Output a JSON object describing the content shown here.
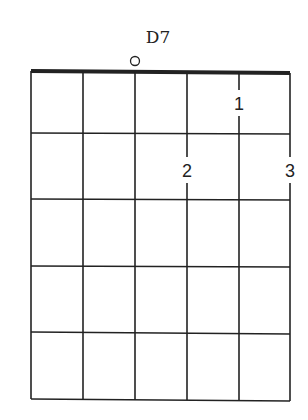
{
  "chord": {
    "name": "D7",
    "strings": 6,
    "frets": 5,
    "open_strings": [
      3
    ],
    "fingers": [
      {
        "string": 5,
        "fret": 1,
        "finger": "1"
      },
      {
        "string": 4,
        "fret": 2,
        "finger": "2"
      },
      {
        "string": 6,
        "fret": 2,
        "finger": "3"
      }
    ]
  },
  "colors": {
    "line": "#222222",
    "background": "#ffffff"
  }
}
